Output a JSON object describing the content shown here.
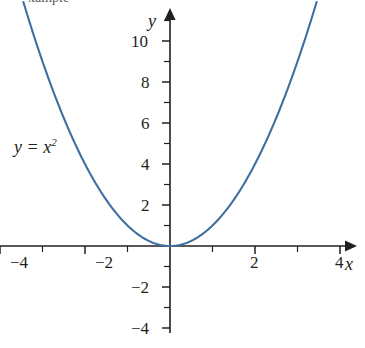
{
  "figure": {
    "background_color": "#ffffff",
    "top_cropped_caption": "xample"
  },
  "chart_data": {
    "type": "line",
    "title": "",
    "subtitle": "",
    "xlabel": "x",
    "ylabel": "y",
    "grid": false,
    "legend_position": "none",
    "annotations": [
      {
        "text": "y = x²",
        "text_base": "y = x",
        "text_exponent": "2",
        "x": -3.2,
        "y": 4.4,
        "pixel_x": 14,
        "pixel_y": 138
      }
    ],
    "axes": {
      "x": {
        "label": "x",
        "range": [
          -4.6,
          4.3
        ],
        "major_ticks": [
          -4,
          -2,
          2,
          4
        ],
        "major_tick_labels": [
          "−4",
          "−2",
          "2",
          "4"
        ],
        "minor_ticks": [
          -3,
          -1,
          1,
          3
        ],
        "arrow_positive_end": true,
        "origin_pixel": 170,
        "pixels_per_unit": 42.5
      },
      "y": {
        "label": "y",
        "range": [
          -4.9,
          11.8
        ],
        "major_ticks": [
          -4,
          -2,
          2,
          4,
          6,
          8,
          10
        ],
        "major_tick_labels": [
          "−4",
          "−2",
          "2",
          "4",
          "6",
          "8",
          "10"
        ],
        "minor_ticks": [
          -3,
          -1,
          1,
          3,
          5,
          7,
          9,
          11
        ],
        "arrow_positive_end": true,
        "origin_pixel": 246,
        "pixels_per_unit": 20.5
      }
    },
    "series": [
      {
        "name": "y = x²",
        "equation": "y = x^2",
        "color": "#3f6f9f",
        "line_width": 2.1,
        "x_domain": [
          -3.45,
          3.45
        ],
        "x": [
          -3.45,
          -3.2,
          -3.0,
          -2.75,
          -2.5,
          -2.25,
          -2.0,
          -1.75,
          -1.5,
          -1.25,
          -1.0,
          -0.75,
          -0.5,
          -0.25,
          0,
          0.25,
          0.5,
          0.75,
          1.0,
          1.25,
          1.5,
          1.75,
          2.0,
          2.25,
          2.5,
          2.75,
          3.0,
          3.2,
          3.45
        ],
        "y": [
          11.9,
          10.24,
          9.0,
          7.5625,
          6.25,
          5.0625,
          4.0,
          3.0625,
          2.25,
          1.5625,
          1.0,
          0.5625,
          0.25,
          0.0625,
          0,
          0.0625,
          0.25,
          0.5625,
          1.0,
          1.5625,
          2.25,
          3.0625,
          4.0,
          5.0625,
          6.25,
          7.5625,
          9.0,
          10.24,
          11.9
        ],
        "vertex": [
          0,
          0
        ]
      }
    ],
    "colors": {
      "curve": "#3f6f9f",
      "axis": "#231f20",
      "text": "#231f20"
    }
  }
}
